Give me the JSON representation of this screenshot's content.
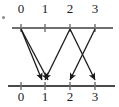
{
  "diagram": {
    "colors": {
      "axis": "#6f6f6f",
      "arrow": "#1a1a1a",
      "label": "#1a1a1a",
      "background": "#ffffff"
    },
    "top_axis": {
      "name": "top-number-line",
      "y": 28,
      "x_start": 12,
      "x_end": 113,
      "ticks": [
        {
          "value": "0",
          "x": 21
        },
        {
          "value": "1",
          "x": 45
        },
        {
          "value": "2",
          "x": 70
        },
        {
          "value": "3",
          "x": 95
        }
      ]
    },
    "bottom_axis": {
      "name": "bottom-number-line",
      "y": 86,
      "x_start": 8,
      "x_end": 115,
      "ticks": [
        {
          "value": "0",
          "x": 21
        },
        {
          "value": "1",
          "x": 45
        },
        {
          "value": "2",
          "x": 70
        },
        {
          "value": "3",
          "x": 95
        }
      ]
    },
    "arrows": [
      {
        "name": "arrow-0-to-1a",
        "from": 0,
        "to": 1,
        "x1": 21,
        "y1": 29,
        "x2": 42,
        "y2": 80
      },
      {
        "name": "arrow-0-to-1b",
        "from": 0,
        "to": 1,
        "x1": 21,
        "y1": 29,
        "x2": 48,
        "y2": 80
      },
      {
        "name": "arrow-2-to-1",
        "from": 2,
        "to": 1,
        "x1": 70,
        "y1": 29,
        "x2": 45,
        "y2": 80
      },
      {
        "name": "arrow-2-to-3",
        "from": 2,
        "to": 3,
        "x1": 70,
        "y1": 29,
        "x2": 95,
        "y2": 80
      },
      {
        "name": "arrow-3-to-2",
        "from": 3,
        "to": 2,
        "x1": 95,
        "y1": 29,
        "x2": 70,
        "y2": 80
      }
    ],
    "left_mark": {
      "name": "left-edge-mark",
      "visible": true
    }
  }
}
